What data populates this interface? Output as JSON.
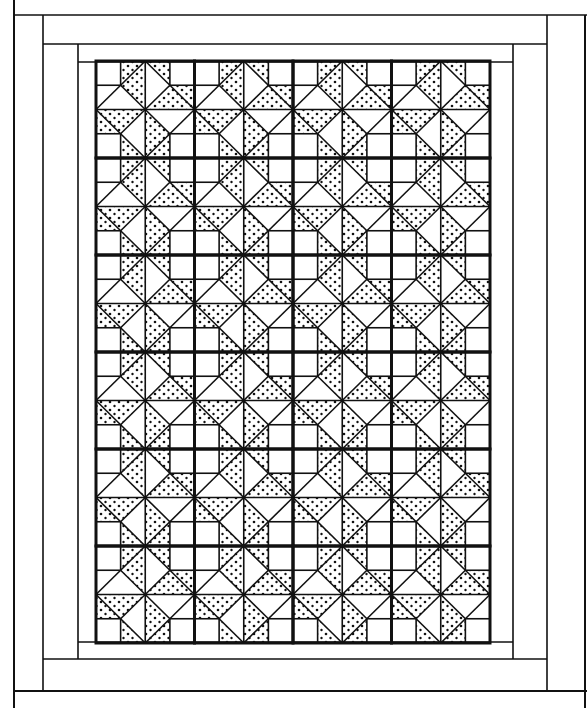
{
  "figure": {
    "type": "quilt-pattern-line-drawing",
    "width": 587,
    "height": 708,
    "colors": {
      "line": "#111111",
      "background": "#ffffff",
      "speckle": "#111111"
    }
  },
  "borders": [
    {
      "name": "outer-border",
      "x": 14,
      "y": 15,
      "w": 573,
      "h": 676
    },
    {
      "name": "middle-border",
      "x": 43,
      "y": 44,
      "w": 504,
      "h": 618
    },
    {
      "name": "inner-border",
      "x": 78,
      "y": 62,
      "w": 435,
      "h": 599
    }
  ],
  "block_grid": {
    "x0": 96,
    "y0": 61,
    "cols": 4,
    "rows": 6,
    "block_w": 98.5,
    "block_h": 97,
    "subdivisions": 4
  }
}
